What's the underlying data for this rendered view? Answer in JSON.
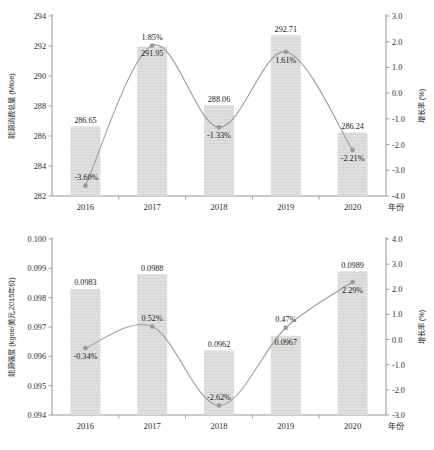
{
  "figure": {
    "charts": [
      {
        "id": "energy-consumption",
        "type": "bar",
        "categories": [
          "2016",
          "2017",
          "2018",
          "2019",
          "2020"
        ],
        "xlabel": "年份",
        "ylabel": "能源消费总量 (Mtoe)",
        "y2label": "增长率 (%)",
        "ylim": [
          282,
          294
        ],
        "yticks": [
          "282",
          "284",
          "286",
          "288",
          "290",
          "292",
          "294"
        ],
        "ytick_values": [
          282,
          284,
          286,
          288,
          290,
          292,
          294
        ],
        "y2lim": [
          -4.0,
          3.0
        ],
        "y2ticks": [
          "-4.0",
          "-3.0",
          "-2.0",
          "-1.0",
          "0.0",
          "1.0",
          "2.0",
          "3.0"
        ],
        "y2tick_values": [
          -4.0,
          -3.0,
          -2.0,
          -1.0,
          0.0,
          1.0,
          2.0,
          3.0
        ],
        "series": [
          {
            "name": "能源消费总量",
            "kind": "bar",
            "axis": "left",
            "values": [
              286.65,
              291.95,
              288.06,
              292.71,
              286.24
            ],
            "labels": [
              "286.65",
              "291.95",
              "288.06",
              "292.71",
              "286.24"
            ],
            "label_positions": [
              "above",
              "inside",
              "above",
              "above",
              "above"
            ],
            "color": "#dededd"
          },
          {
            "name": "增长率",
            "kind": "line",
            "axis": "right",
            "values": [
              -3.6,
              1.85,
              -1.33,
              1.61,
              -2.21
            ],
            "labels": [
              "-3.60%",
              "1.85%",
              "-1.33%",
              "1.61%",
              "-2.21%"
            ],
            "label_positions": [
              "above-left",
              "above",
              "below",
              "below",
              "below"
            ],
            "color": "#9d9d9d"
          }
        ]
      },
      {
        "id": "energy-intensity",
        "type": "bar",
        "categories": [
          "2016",
          "2017",
          "2018",
          "2019",
          "2020"
        ],
        "xlabel": "年份",
        "ylabel": "能源强度 (kgoe/美元,2015年价)",
        "y2label": "增长率 (%)",
        "ylim": [
          0.094,
          0.1
        ],
        "yticks": [
          "0.094",
          "0.095",
          "0.096",
          "0.097",
          "0.098",
          "0.099",
          "0.100"
        ],
        "ytick_values": [
          0.094,
          0.095,
          0.096,
          0.097,
          0.098,
          0.099,
          0.1
        ],
        "y2lim": [
          -3.0,
          4.0
        ],
        "y2ticks": [
          "-3.0",
          "-2.0",
          "-1.0",
          "0.0",
          "1.0",
          "2.0",
          "3.0",
          "4.0"
        ],
        "y2tick_values": [
          -3.0,
          -2.0,
          -1.0,
          0.0,
          1.0,
          2.0,
          3.0,
          4.0
        ],
        "series": [
          {
            "name": "能源强度",
            "kind": "bar",
            "axis": "left",
            "values": [
              0.0983,
              0.0988,
              0.0962,
              0.0967,
              0.0989
            ],
            "labels": [
              "0.0983",
              "0.0988",
              "0.0962",
              "0.0967",
              "0.0989"
            ],
            "label_positions": [
              "above",
              "above",
              "above",
              "inside",
              "above"
            ],
            "color": "#dededd"
          },
          {
            "name": "增长率",
            "kind": "line",
            "axis": "right",
            "values": [
              -0.34,
              0.52,
              -2.62,
              0.47,
              2.29
            ],
            "labels": [
              "-0.34%",
              "0.52%",
              "-2.62%",
              "0.47%",
              "2.29%"
            ],
            "label_positions": [
              "below",
              "above",
              "above",
              "above",
              "below"
            ],
            "color": "#9d9d9d"
          }
        ]
      }
    ]
  },
  "chart_data": [
    {
      "type": "bar",
      "title": "",
      "categories": [
        "2016",
        "2017",
        "2018",
        "2019",
        "2020"
      ],
      "xlabel": "年份",
      "ylabel": "能源消费总量 (Mtoe)",
      "y2label": "增长率 (%)",
      "ylim": [
        282,
        294
      ],
      "y2lim": [
        -4.0,
        3.0
      ],
      "grid": false,
      "legend": "none",
      "series": [
        {
          "name": "能源消费总量 (Mtoe)",
          "type": "bar",
          "axis": "left",
          "values": [
            286.65,
            291.95,
            288.06,
            292.71,
            286.24
          ]
        },
        {
          "name": "增长率 (%)",
          "type": "line",
          "axis": "right",
          "values": [
            -3.6,
            1.85,
            -1.33,
            1.61,
            -2.21
          ]
        }
      ]
    },
    {
      "type": "bar",
      "title": "",
      "categories": [
        "2016",
        "2017",
        "2018",
        "2019",
        "2020"
      ],
      "xlabel": "年份",
      "ylabel": "能源强度 (kgoe/美元,2015年价)",
      "y2label": "增长率 (%)",
      "ylim": [
        0.094,
        0.1
      ],
      "y2lim": [
        -3.0,
        4.0
      ],
      "grid": false,
      "legend": "none",
      "series": [
        {
          "name": "能源强度 (kgoe/美元,2015年价)",
          "type": "bar",
          "axis": "left",
          "values": [
            0.0983,
            0.0988,
            0.0962,
            0.0967,
            0.0989
          ]
        },
        {
          "name": "增长率 (%)",
          "type": "line",
          "axis": "right",
          "values": [
            -0.34,
            0.52,
            -2.62,
            0.47,
            2.29
          ]
        }
      ]
    }
  ]
}
